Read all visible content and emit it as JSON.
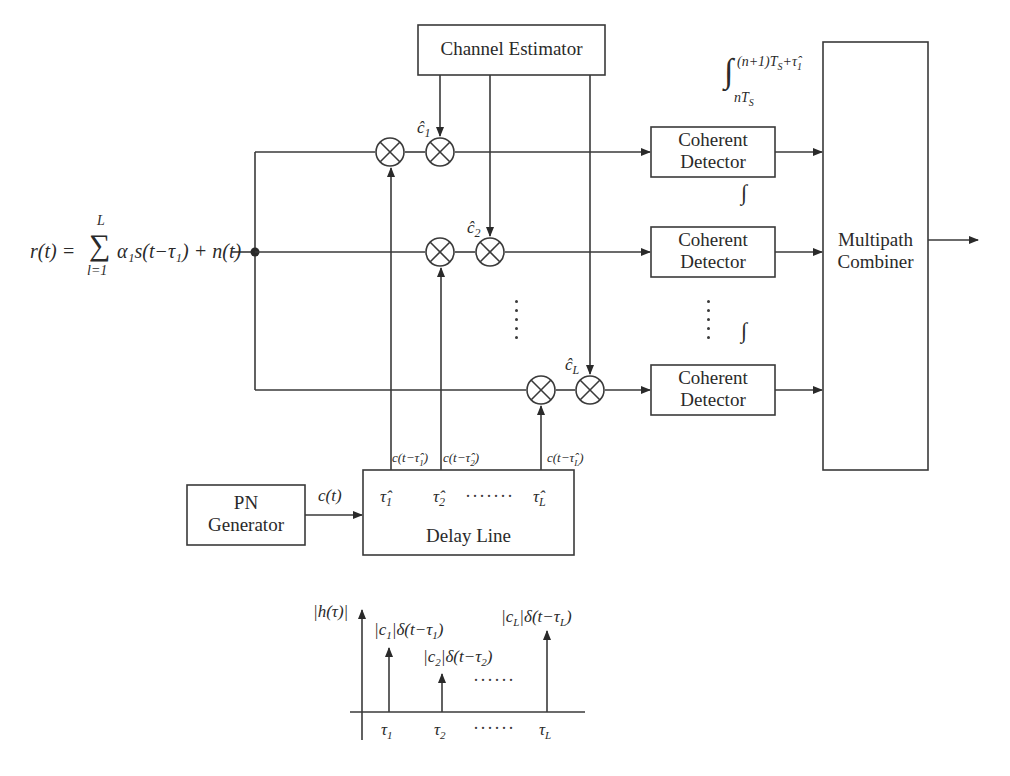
{
  "diagram": {
    "input_signal": "r(t) = Σ α₁s(t − τ₁) + n(t)",
    "input_signal_parts": {
      "lhs": "r(t) =",
      "sum_upper": "L",
      "sum_lower": "l=1",
      "sigma": "∑",
      "rhs": "α₁s(t−τ₁) + n(t)"
    },
    "blocks": {
      "channel_estimator": "Channel Estimator",
      "coherent_detector_1": [
        "Coherent",
        "Detector"
      ],
      "coherent_detector_2": [
        "Coherent",
        "Detector"
      ],
      "coherent_detector_L": [
        "Coherent",
        "Detector"
      ],
      "multipath_combiner": [
        "Multipath",
        "Combiner"
      ],
      "pn_generator": [
        "PN",
        "Generator"
      ],
      "delay_line": "Delay Line"
    },
    "channel_estimates": [
      "ĉ₁",
      "ĉ₂",
      "ĉ_L"
    ],
    "channel_estimate_parts": [
      {
        "base": "ĉ",
        "sub": "1"
      },
      {
        "base": "ĉ",
        "sub": "2"
      },
      {
        "base": "ĉ",
        "sub": "L"
      }
    ],
    "integral_label": {
      "symbol": "∫",
      "upper": "(n+1)T",
      "upper_sub": "S",
      "upper_tail": "+τ̂",
      "upper_tail_sub": "1",
      "lower": "nT",
      "lower_sub": "S"
    },
    "integral_small": "∫",
    "pn_output": "c(t)",
    "delay_taps": [
      {
        "base": "τ̂",
        "sub": "1"
      },
      {
        "base": "τ̂",
        "sub": "2"
      },
      {
        "base": "τ̂",
        "sub": "L"
      }
    ],
    "delay_dots": "·······",
    "tap_outputs": [
      {
        "pre": "c(t−",
        "base": "τ̂",
        "sub": "1",
        "post": ")"
      },
      {
        "pre": "c(t−",
        "base": "τ̂",
        "sub": "2",
        "post": ")"
      },
      {
        "pre": "c(t−",
        "base": "τ̂",
        "sub": "L",
        "post": ")"
      }
    ],
    "impulse_response": {
      "axis_label": "|h(τ)|",
      "impulses": [
        {
          "label_pre": "|c",
          "label_sub": "1",
          "label_mid": "|δ(t−τ",
          "label_sub2": "1",
          "label_post": ")",
          "tick": "τ",
          "tick_sub": "1"
        },
        {
          "label_pre": "|c",
          "label_sub": "2",
          "label_mid": "|δ(t−τ",
          "label_sub2": "2",
          "label_post": ")",
          "tick": "τ",
          "tick_sub": "2"
        },
        {
          "label_pre": "|c",
          "label_sub": "L",
          "label_mid": "|δ(t−τ",
          "label_sub2": "L",
          "label_post": ")",
          "tick": "τ",
          "tick_sub": "L"
        }
      ],
      "dots": "······"
    }
  }
}
